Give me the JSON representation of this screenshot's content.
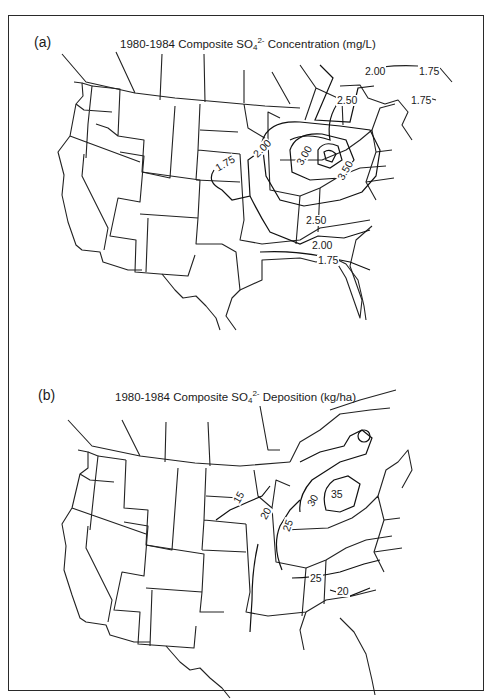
{
  "figure": {
    "panels": [
      {
        "id": "a",
        "letter": "(a)",
        "title_pre": "1980-1984 Composite SO",
        "title_sub": "4",
        "title_sup": "2-",
        "title_post": " Concentration (mg/L)",
        "variable": "SO4 2- concentration",
        "units": "mg/L",
        "contour_labels": [
          {
            "value": "2.00",
            "x": 364,
            "y": 73
          },
          {
            "value": "1.75",
            "x": 418,
            "y": 72
          },
          {
            "value": "2.50",
            "x": 336,
            "y": 101
          },
          {
            "value": "1.75",
            "x": 410,
            "y": 100
          },
          {
            "value": "2.00",
            "x": 251,
            "y": 148
          },
          {
            "value": "1.75",
            "x": 216,
            "y": 163
          },
          {
            "value": "3.00",
            "x": 296,
            "y": 152
          },
          {
            "value": "3.50",
            "x": 337,
            "y": 166
          },
          {
            "value": "2.50",
            "x": 305,
            "y": 220
          },
          {
            "value": "2.00",
            "x": 311,
            "y": 243
          },
          {
            "value": "1.75",
            "x": 317,
            "y": 257
          }
        ]
      },
      {
        "id": "b",
        "letter": "(b)",
        "title_pre": "1980-1984 Composite SO",
        "title_sub": "4",
        "title_sup": "2-",
        "title_post": " Deposition (kg/ha)",
        "variable": "SO4 2- deposition",
        "units": "kg/ha",
        "contour_labels": [
          {
            "value": "15",
            "x": 234,
            "y": 497
          },
          {
            "value": "20",
            "x": 261,
            "y": 513
          },
          {
            "value": "25",
            "x": 283,
            "y": 525
          },
          {
            "value": "30",
            "x": 308,
            "y": 500
          },
          {
            "value": "35",
            "x": 332,
            "y": 494
          },
          {
            "value": "25",
            "x": 309,
            "y": 578
          },
          {
            "value": "20",
            "x": 336,
            "y": 591
          }
        ]
      }
    ]
  }
}
